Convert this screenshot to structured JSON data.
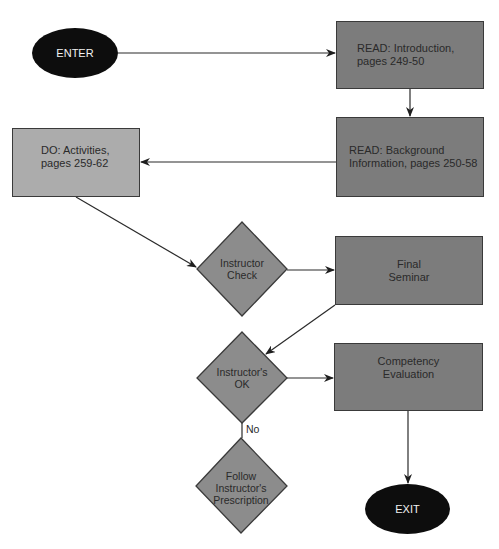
{
  "colors": {
    "dark_box": "#7c7c7c",
    "light_box": "#acacac",
    "diamond": "#8c8c8c",
    "terminal": "#0d0d0d",
    "line": "#2a2a2a"
  },
  "nodes": {
    "enter": {
      "label": "ENTER"
    },
    "read_intro": {
      "line1": "READ: Introduction,",
      "line2": "pages 249-50"
    },
    "read_background": {
      "line1": "READ: Background",
      "line2": "Information, pages 250-58"
    },
    "do_activities": {
      "line1": "DO: Activities,",
      "line2": "pages 259-62"
    },
    "instructor_check": {
      "line1": "Instructor",
      "line2": "Check"
    },
    "final_seminar": {
      "line1": "Final",
      "line2": "Seminar"
    },
    "instructors_ok": {
      "line1": "Instructor's",
      "line2": "OK"
    },
    "competency_evaluation": {
      "line1": "Competency",
      "line2": "Evaluation"
    },
    "follow_prescription": {
      "line1": "Follow",
      "line2": "Instructor's",
      "line3": "Prescription"
    },
    "exit": {
      "label": "EXIT"
    }
  },
  "edge_labels": {
    "no": "No"
  }
}
